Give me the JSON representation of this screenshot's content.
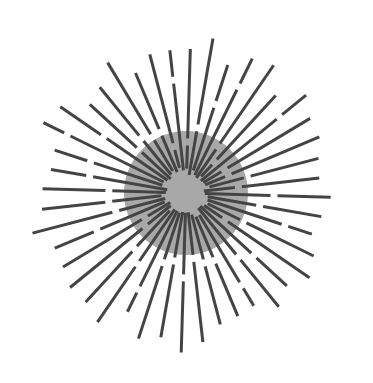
{
  "figure": {
    "background": "#ffffff",
    "center": [
      186,
      193
    ],
    "disk": {
      "radius": 62,
      "color": "#a8a8a8"
    },
    "inner_disk": {
      "radius": 30,
      "color": "#a3a3a3"
    },
    "rays": {
      "count": 44,
      "inner_radius": 18,
      "color": "#444444",
      "width": 3
    }
  }
}
